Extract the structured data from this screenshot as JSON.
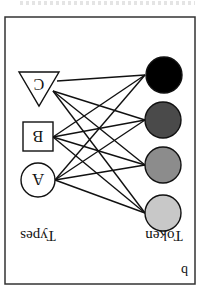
{
  "figure": {
    "orientation": "rotated 180 degrees",
    "panel_label": "b",
    "token_label": "Token",
    "types_label": "Types",
    "types": [
      {
        "shape": "circle",
        "letter": "A"
      },
      {
        "shape": "square",
        "letter": "B"
      },
      {
        "shape": "triangle",
        "letter": "C"
      }
    ],
    "tokens": [
      {
        "fill": "#c8c8c8"
      },
      {
        "fill": "#8c8c8c"
      },
      {
        "fill": "#4a4a4a"
      },
      {
        "fill": "#000000"
      }
    ],
    "edges": "complete bipartite: every type connected to every token (12 edges)",
    "colors": {
      "stroke": "#111111",
      "frame": "#333333",
      "background": "#ffffff"
    }
  }
}
